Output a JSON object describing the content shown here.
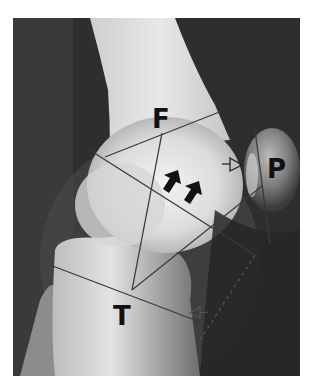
{
  "image": {
    "description": "Lateral knee radiograph with annotated geometric lines",
    "labels": {
      "femur": "F",
      "patella": "P",
      "tibia": "T"
    },
    "annotations": {
      "solid_arrows": 2,
      "hollow_arrows": 2
    },
    "colors": {
      "background": "#2b2b2b",
      "bone": "#e6e6e6",
      "line": "#3a3a3a",
      "label": "#111111"
    }
  }
}
